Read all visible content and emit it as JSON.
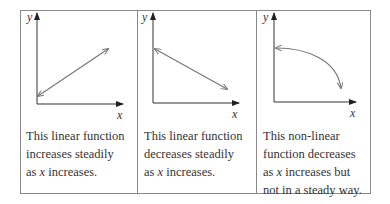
{
  "panels": [
    {
      "id": "linear-increasing",
      "y_label": "y",
      "x_label": "x",
      "curve_type": "linear-increasing",
      "caption_lines": [
        "This linear function",
        "increases steadily",
        "as x increases."
      ]
    },
    {
      "id": "linear-decreasing",
      "y_label": "y",
      "x_label": "x",
      "curve_type": "linear-decreasing",
      "caption_lines": [
        "This linear function",
        "decreases steadily",
        "as x increases."
      ]
    },
    {
      "id": "nonlinear-decreasing",
      "y_label": "y",
      "x_label": "x",
      "curve_type": "nonlinear-decreasing",
      "caption_lines": [
        "This non-linear",
        "function decreases",
        "as x increases but",
        "not in a steady way."
      ]
    }
  ],
  "colors": {
    "border": "#8a8a8a",
    "axis": "#333333",
    "curve": "#777777",
    "text": "#333333"
  }
}
